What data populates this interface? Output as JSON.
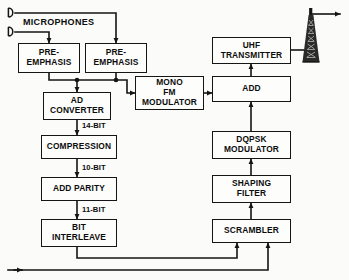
{
  "diagram": {
    "background_color": "#fbfbf9",
    "line_color": "#151515",
    "text_color": "#0c0c0c"
  },
  "sources": {
    "microphones_label": "MICROPHONES",
    "mic_icon_name": "microphone-icon",
    "mic_count": 2
  },
  "blocks": [
    {
      "id": "pre_emphasis_1",
      "label": "PRE-\nEMPHASIS",
      "x": 18,
      "y": 43,
      "w": 62,
      "h": 30
    },
    {
      "id": "pre_emphasis_2",
      "label": "PRE-\nEMPHASIS",
      "x": 85,
      "y": 43,
      "w": 62,
      "h": 30
    },
    {
      "id": "ad_converter",
      "label": "AD\nCONVERTER",
      "x": 43,
      "y": 92,
      "w": 68,
      "h": 28
    },
    {
      "id": "compression",
      "label": "COMPRESSION",
      "x": 41,
      "y": 135,
      "w": 76,
      "h": 24
    },
    {
      "id": "add_parity",
      "label": "ADD  PARITY",
      "x": 41,
      "y": 177,
      "w": 76,
      "h": 24
    },
    {
      "id": "bit_interleave",
      "label": "BIT\nINTERLEAVE",
      "x": 41,
      "y": 219,
      "w": 76,
      "h": 28
    },
    {
      "id": "mono_fm_modulator",
      "label": "MONO\nFM\nMODULATOR",
      "x": 135,
      "y": 76,
      "w": 69,
      "h": 34
    },
    {
      "id": "uhf_transmitter",
      "label": "UHF\nTRANSMITTER",
      "x": 212,
      "y": 37,
      "w": 79,
      "h": 27
    },
    {
      "id": "add",
      "label": "ADD",
      "x": 212,
      "y": 76,
      "w": 79,
      "h": 26
    },
    {
      "id": "dqpsk_modulator",
      "label": "DQPSK\nMODULATOR",
      "x": 212,
      "y": 131,
      "w": 79,
      "h": 28
    },
    {
      "id": "shaping_filter",
      "label": "SHAPING\nFILTER",
      "x": 212,
      "y": 175,
      "w": 79,
      "h": 28
    },
    {
      "id": "scrambler",
      "label": "SCRAMBLER",
      "x": 212,
      "y": 219,
      "w": 79,
      "h": 24
    }
  ],
  "bus_labels": [
    {
      "id": "bus_14bit",
      "text": "14-BIT",
      "x": 79,
      "y": 120
    },
    {
      "id": "bus_10bit",
      "text": "10-BIT",
      "x": 79,
      "y": 162
    },
    {
      "id": "bus_11bit",
      "text": "11-BIT",
      "x": 79,
      "y": 204
    }
  ],
  "antenna": {
    "name": "transmitting-antenna-tower",
    "x": 300,
    "y": 8,
    "w": 22,
    "h": 55
  },
  "external_input": {
    "name": "external-data-input-line",
    "description": "arrow entering from bottom-left edge to scrambler"
  }
}
